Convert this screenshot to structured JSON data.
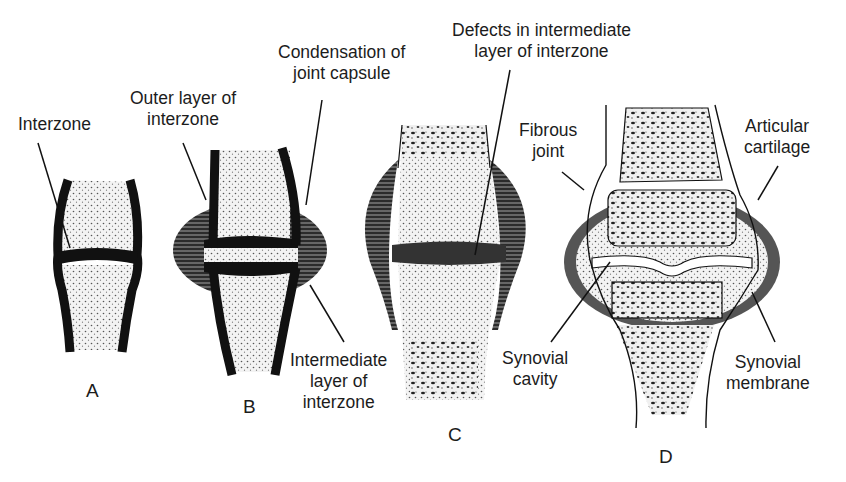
{
  "figure": {
    "panels": [
      {
        "id": "A",
        "label": "A"
      },
      {
        "id": "B",
        "label": "B"
      },
      {
        "id": "C",
        "label": "C"
      },
      {
        "id": "D",
        "label": "D"
      }
    ],
    "annotations": {
      "interzone": "Interzone",
      "outer_layer_1": "Outer layer of",
      "outer_layer_2": "interzone",
      "condensation_1": "Condensation of",
      "condensation_2": "joint capsule",
      "defects_1": "Defects in intermediate",
      "defects_2": "layer of interzone",
      "fibrous_1": "Fibrous",
      "fibrous_2": "joint",
      "articular_1": "Articular",
      "articular_2": "cartilage",
      "intermediate_1": "Intermediate",
      "intermediate_2": "layer of",
      "intermediate_3": "interzone",
      "synovial_cavity_1": "Synovial",
      "synovial_cavity_2": "cavity",
      "synovial_membrane_1": "Synovial",
      "synovial_membrane_2": "membrane"
    },
    "colors": {
      "ink": "#111111",
      "paper": "#ffffff",
      "stipple": "#e9e9e9"
    }
  }
}
